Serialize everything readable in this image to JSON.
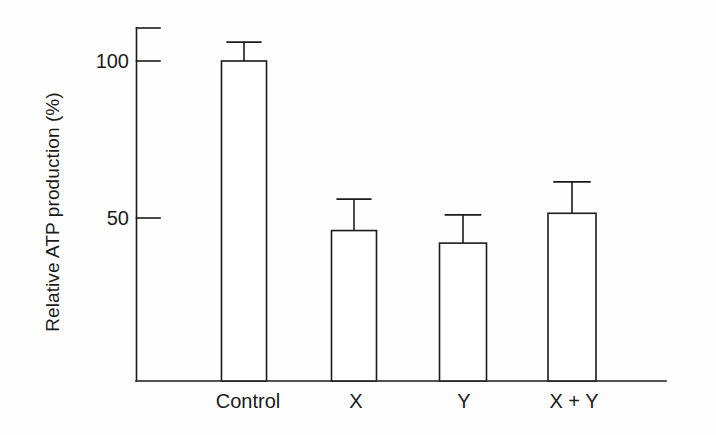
{
  "figure": {
    "background_color": "#fefefe",
    "ink_color": "#1b1b1b"
  },
  "chart_data": {
    "type": "bar",
    "title": "",
    "subtitle": "",
    "xlabel": "",
    "ylabel": "Relative ATP production (%)",
    "categories": [
      "Control",
      "X",
      "Y",
      "X + Y"
    ],
    "values": [
      100,
      46,
      42,
      51.5
    ],
    "errors_upper": [
      6,
      10,
      9,
      10
    ],
    "errors_lower": [
      0,
      0,
      0,
      0
    ],
    "error_bar_style": "upper-only-with-cap",
    "bar_fill": "#ffffff",
    "bar_edge_color": "#1b1b1b",
    "ylim": [
      0,
      112
    ],
    "yticks": [
      50,
      100
    ],
    "ytick_labels": [
      "50",
      "100"
    ],
    "grid": false,
    "legend": null,
    "legend_position": "none",
    "axis_style": "left-and-bottom-spines-with-top-cap"
  },
  "axis": {
    "ytick_100": "100",
    "ytick_50": "50",
    "ylabel_text": "Relative ATP production (%)"
  },
  "xlabels": {
    "control": "Control",
    "x": "X",
    "y": "Y",
    "x_plus_y": "X + Y"
  }
}
